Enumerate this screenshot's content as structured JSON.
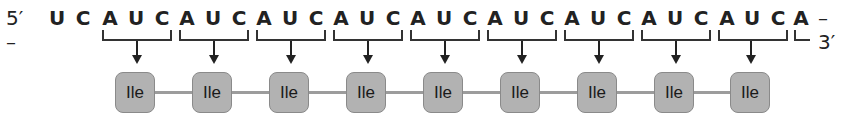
{
  "diagram": {
    "five_prime_label": "5′ –",
    "three_prime_label": "– 3′",
    "sequence": [
      "U",
      "C",
      "A",
      "U",
      "C",
      "A",
      "U",
      "C",
      "A",
      "U",
      "C",
      "A",
      "U",
      "C",
      "A",
      "U",
      "C",
      "A",
      "U",
      "C",
      "A",
      "U",
      "C",
      "A",
      "U",
      "C",
      "A",
      "U",
      "C",
      "A"
    ],
    "codons": [
      "AUC",
      "AUC",
      "AUC",
      "AUC",
      "AUC",
      "AUC",
      "AUC",
      "AUC",
      "AUC"
    ],
    "amino_acids": [
      "Ile",
      "Ile",
      "Ile",
      "Ile",
      "Ile",
      "Ile",
      "Ile",
      "Ile",
      "Ile"
    ],
    "colors": {
      "amino_acid_fill": "#b2b2b2",
      "amino_acid_border": "#8a8a8a",
      "chain_line": "#9c9c9c",
      "text": "#222222"
    }
  }
}
